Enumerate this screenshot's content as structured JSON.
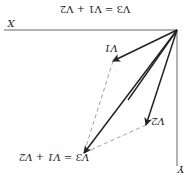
{
  "figure": {
    "orientation": "rotated 180 degrees",
    "title_fragment": "V3 = V1 + V2",
    "axes": {
      "x_label": "X",
      "y_label": "Y"
    },
    "vectors": [
      {
        "name": "V1",
        "label": "V1",
        "style": "solid"
      },
      {
        "name": "V2",
        "label": "V2",
        "style": "solid"
      },
      {
        "name": "V3",
        "label": "V3 = V1 + V2",
        "style": "solid"
      }
    ],
    "construction_lines": [
      {
        "from": "V1 tip",
        "to": "V3 tip",
        "style": "dashed"
      },
      {
        "from": "V2 tip",
        "to": "V3 tip",
        "style": "dashed"
      }
    ],
    "colors": {
      "line": "#222222",
      "dashed": "#888888",
      "axis": "#555555"
    }
  }
}
